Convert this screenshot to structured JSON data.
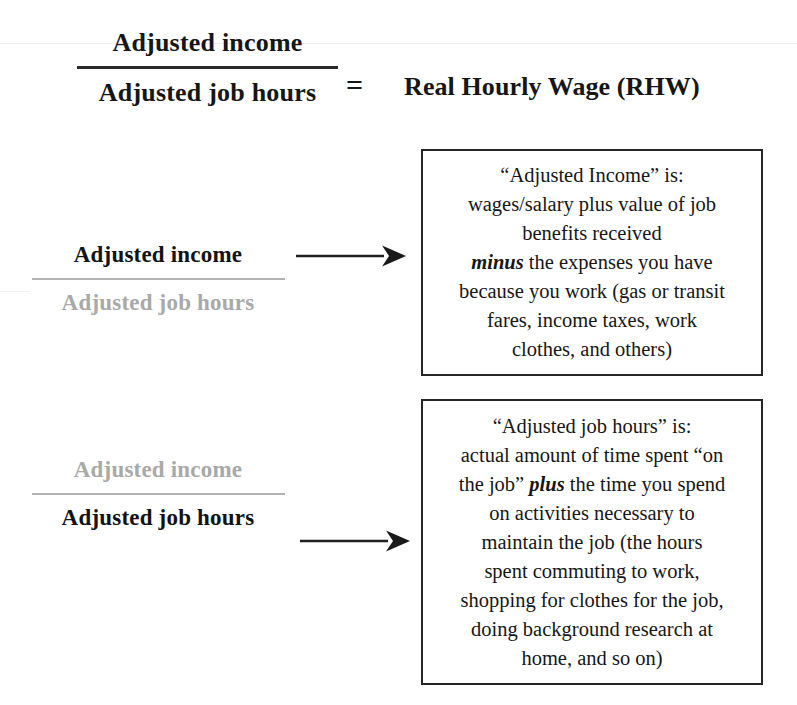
{
  "diagram": {
    "type": "formula-explanation-diagram",
    "title_equation": {
      "numerator": "Adjusted income",
      "denominator": "Adjusted job hours",
      "equals": "=",
      "result": "Real Hourly Wage (RHW)"
    },
    "rows": [
      {
        "id": "adjusted-income",
        "emphasis": "numerator",
        "numerator": "Adjusted income",
        "denominator": "Adjusted job hours",
        "arrow": "right-arrow",
        "definition": {
          "lines": [
            "“Adjusted Income” is:",
            "wages/salary plus value of job",
            "benefits received"
          ],
          "emphasis_word": "minus",
          "lines_after": [
            " the expenses you have",
            "because you work (gas or transit",
            "fares, income taxes, work",
            "clothes, and others)"
          ]
        }
      },
      {
        "id": "adjusted-job-hours",
        "emphasis": "denominator",
        "numerator": "Adjusted income",
        "denominator": "Adjusted job hours",
        "arrow": "right-arrow",
        "definition": {
          "lines": [
            "“Adjusted job hours” is:",
            "actual amount of time spent “on",
            "the job” "
          ],
          "emphasis_word": "plus",
          "lines_after": [
            " the time you spend",
            "on activities necessary to",
            "maintain the job (the hours",
            "spent commuting to work,",
            "shopping for clothes for the job,",
            "doing background research at",
            "home, and so on)"
          ]
        }
      }
    ],
    "definition_box_1_text": {
      "part_a": "“Adjusted Income” is:\nwages/salary plus value of job\nbenefits received\n",
      "bold_word": "minus",
      "part_b": " the expenses you have\nbecause you work (gas or transit\nfares, income taxes, work\nclothes, and others)"
    },
    "definition_box_2_text": {
      "part_a": "“Adjusted job hours” is:\nactual amount of time spent “on\nthe job” ",
      "bold_word": "plus",
      "part_b": " the time you spend\non activities necessary to\nmaintain the job (the hours\nspent commuting to work,\nshopping for clothes for the job,\ndoing background research at\nhome, and so on)"
    },
    "colors": {
      "text": "#161616",
      "muted_text": "#a9a9a9",
      "rule_dark": "#2a2a2a",
      "rule_muted": "#b2b2b2",
      "box_border": "#262626",
      "background": "#ffffff"
    }
  }
}
